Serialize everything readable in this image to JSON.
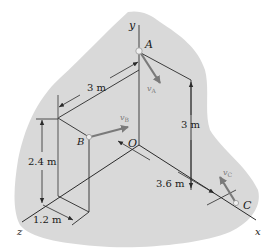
{
  "figure": {
    "type": "3d-kinematics-diagram",
    "colors": {
      "background": "#ffffff",
      "region_fill": "#d9d9d9",
      "line": "#2a2a2a",
      "vector": "#7a7a7a",
      "point": "#eeeeee"
    },
    "axes": {
      "x": "x",
      "y": "y",
      "z": "z",
      "origin": "O"
    },
    "points": {
      "A": "A",
      "B": "B",
      "C": "C"
    },
    "vectors": {
      "vA": "v",
      "vA_sub": "A",
      "vB": "v",
      "vB_sub": "B",
      "vC": "v",
      "vC_sub": "C"
    },
    "dimensions": {
      "top_length": "3 m",
      "right_height": "3 m",
      "left_height": "2.4 m",
      "z_offset": "1.2 m",
      "x_length": "3.6 m"
    }
  }
}
